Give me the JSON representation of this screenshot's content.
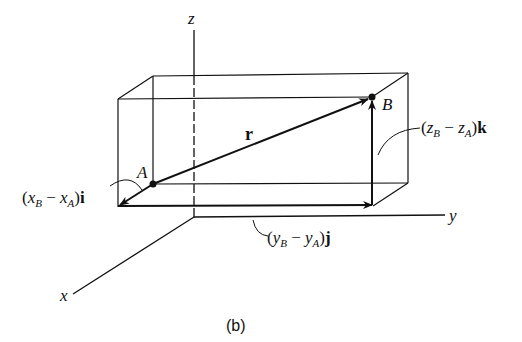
{
  "figure": {
    "caption": "(b)",
    "axes": {
      "x": "x",
      "y": "y",
      "z": "z"
    },
    "points": {
      "A": "A",
      "B": "B"
    },
    "vector_r": "r",
    "components": {
      "i": {
        "open": "(",
        "v1": "x",
        "s1": "B",
        "minus": " − ",
        "v2": "x",
        "s2": "A",
        "close": ")",
        "unit": "i"
      },
      "j": {
        "open": "(",
        "v1": "y",
        "s1": "B",
        "minus": " − ",
        "v2": "y",
        "s2": "A",
        "close": ")",
        "unit": "j"
      },
      "k": {
        "open": "(",
        "v1": "z",
        "s1": "B",
        "minus": " − ",
        "v2": "z",
        "s2": "A",
        "close": ")",
        "unit": "k"
      }
    },
    "colors": {
      "ink": "#111111",
      "background": "#ffffff"
    }
  }
}
